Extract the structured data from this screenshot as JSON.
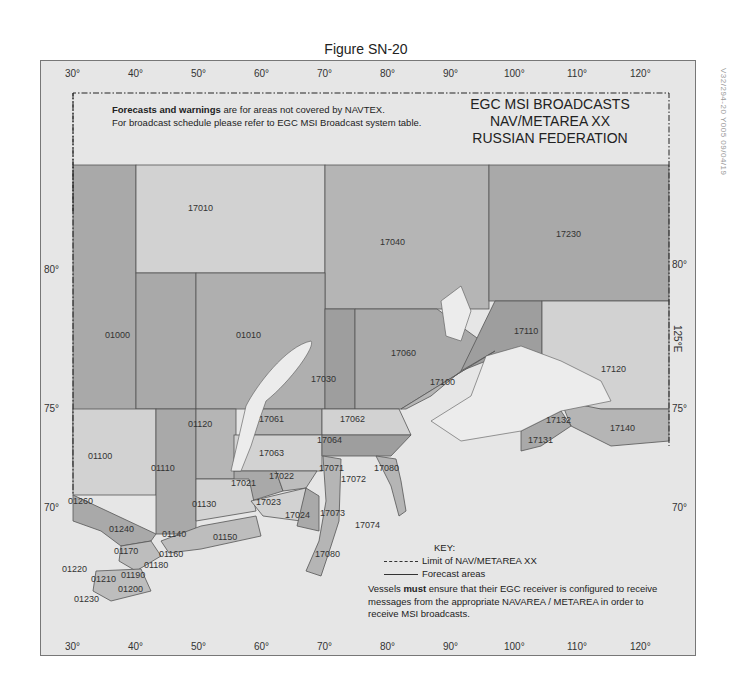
{
  "figure": {
    "title": "Figure SN-20",
    "side_code": "V32/294-20  Y005  09/04/19"
  },
  "header_notes": {
    "line1_bold": "Forecasts and warnings",
    "line1_rest": " are for areas not covered by NAVTEX.",
    "line2": "For broadcast schedule please refer to EGC MSI Broadcast system table."
  },
  "map_title": {
    "line1": "EGC MSI BROADCASTS",
    "line2": "NAV/METAREA XX",
    "line3": "RUSSIAN FEDERATION"
  },
  "axes": {
    "top_longitudes": [
      "30°",
      "40°",
      "50°",
      "60°",
      "70°",
      "80°",
      "90°",
      "100°",
      "110°",
      "120°"
    ],
    "bottom_longitudes": [
      "30°",
      "40°",
      "50°",
      "60°",
      "70°",
      "80°",
      "90°",
      "100°",
      "110°",
      "120°"
    ],
    "left_latitudes": [
      "80°",
      "75°",
      "70°"
    ],
    "right_latitudes": [
      "80°",
      "75°",
      "70°"
    ],
    "right_meridian_label": "125°E"
  },
  "forecast_areas": [
    {
      "id": "17010",
      "x": 200,
      "y": 209
    },
    {
      "id": "17040",
      "x": 392,
      "y": 243
    },
    {
      "id": "17230",
      "x": 568,
      "y": 235
    },
    {
      "id": "01000",
      "x": 117,
      "y": 336
    },
    {
      "id": "01010",
      "x": 248,
      "y": 336
    },
    {
      "id": "17030",
      "x": 323,
      "y": 380
    },
    {
      "id": "17060",
      "x": 403,
      "y": 354
    },
    {
      "id": "17110",
      "x": 526,
      "y": 332
    },
    {
      "id": "17120",
      "x": 613,
      "y": 370
    },
    {
      "id": "17100",
      "x": 442,
      "y": 383
    },
    {
      "id": "17061",
      "x": 271,
      "y": 420
    },
    {
      "id": "17062",
      "x": 352,
      "y": 420
    },
    {
      "id": "01120",
      "x": 200,
      "y": 425
    },
    {
      "id": "17064",
      "x": 329,
      "y": 441
    },
    {
      "id": "17063",
      "x": 271,
      "y": 454
    },
    {
      "id": "01100",
      "x": 100,
      "y": 457
    },
    {
      "id": "01110",
      "x": 163,
      "y": 469
    },
    {
      "id": "17071",
      "x": 331,
      "y": 469
    },
    {
      "id": "17080",
      "x": 386,
      "y": 469
    },
    {
      "id": "17072",
      "x": 353,
      "y": 480
    },
    {
      "id": "17022",
      "x": 281,
      "y": 477
    },
    {
      "id": "17021",
      "x": 243,
      "y": 484
    },
    {
      "id": "17132",
      "x": 558,
      "y": 421
    },
    {
      "id": "17140",
      "x": 622,
      "y": 429
    },
    {
      "id": "17131",
      "x": 540,
      "y": 441
    },
    {
      "id": "01130",
      "x": 204,
      "y": 505
    },
    {
      "id": "17023",
      "x": 268,
      "y": 503
    },
    {
      "id": "01260",
      "x": 80,
      "y": 502
    },
    {
      "id": "17024",
      "x": 297,
      "y": 516
    },
    {
      "id": "17073",
      "x": 332,
      "y": 514
    },
    {
      "id": "17074",
      "x": 367,
      "y": 526
    },
    {
      "id": "01240",
      "x": 121,
      "y": 530
    },
    {
      "id": "01140",
      "x": 174,
      "y": 535
    },
    {
      "id": "01150",
      "x": 225,
      "y": 538
    },
    {
      "id": "01170",
      "x": 126,
      "y": 552
    },
    {
      "id": "01160",
      "x": 171,
      "y": 555
    },
    {
      "id": "17080",
      "x": 327,
      "y": 555
    },
    {
      "id": "01180",
      "x": 156,
      "y": 566
    },
    {
      "id": "01220",
      "x": 74,
      "y": 570
    },
    {
      "id": "01190",
      "x": 133,
      "y": 576
    },
    {
      "id": "01210",
      "x": 103,
      "y": 580
    },
    {
      "id": "01200",
      "x": 130,
      "y": 590
    },
    {
      "id": "01230",
      "x": 86,
      "y": 600
    }
  ],
  "key": {
    "heading": "KEY:",
    "limit_label": "Limit of NAV/METAREA XX",
    "forecast_label": "Forecast areas"
  },
  "vessels_note": {
    "prefix": "Vessels ",
    "bold": "must",
    "rest": " ensure that their EGC receiver is configured to receive messages from the appropriate NAVAREA / METAREA in order to receive MSI broadcasts."
  },
  "colors": {
    "sea_light": "#e6e6e6",
    "zone_dark": "#a9a9a9",
    "zone_mid": "#bdbdbd",
    "zone_light": "#d2d2d2",
    "land": "#ececec",
    "border": "#555555"
  }
}
